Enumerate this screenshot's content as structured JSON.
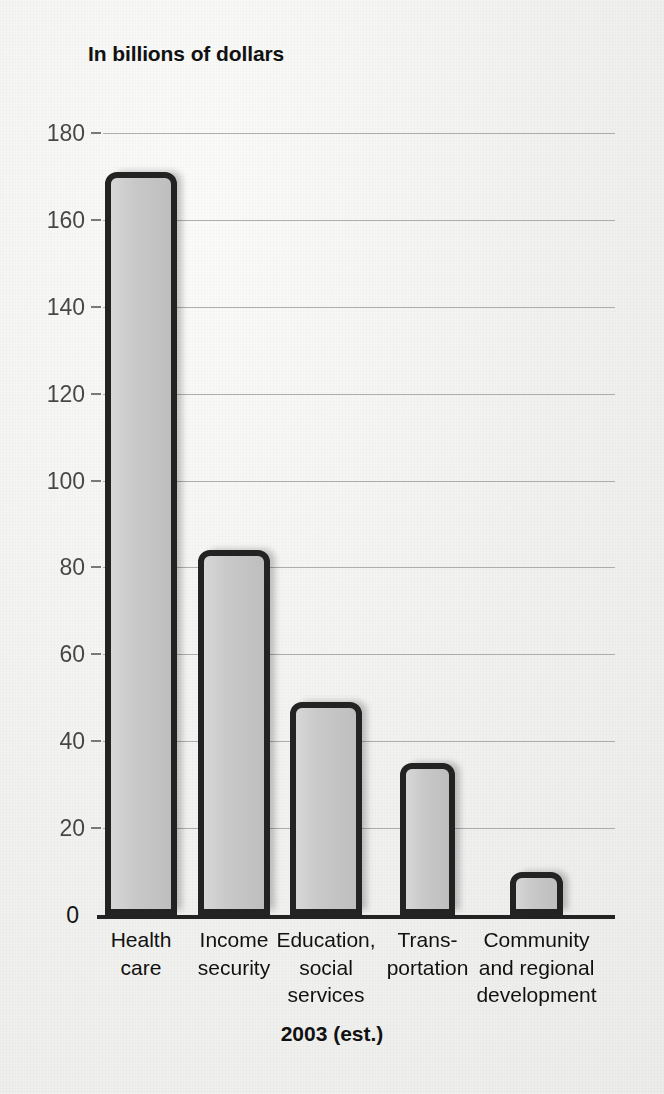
{
  "chart_data": {
    "type": "bar",
    "title": "In billions of dollars",
    "xlabel": "2003 (est.)",
    "ylabel": "",
    "categories": [
      "Health\ncare",
      "Income\nsecurity",
      "Education,\nsocial\nservices",
      "Trans-\nportation",
      "Community\nand regional\ndevelopment"
    ],
    "values": [
      171,
      84,
      49,
      35,
      10
    ],
    "ylim": [
      0,
      180
    ],
    "yticks": [
      0,
      20,
      40,
      60,
      80,
      100,
      120,
      140,
      160,
      180
    ],
    "ytick_labels": [
      "0",
      "20",
      "40",
      "60",
      "80",
      "100",
      "120",
      "140",
      "160",
      "180"
    ],
    "grid": true,
    "legend": false,
    "legend_position": "none",
    "colors": {
      "bar_fill": "#c6c6c6",
      "bar_outline": "#232323",
      "gridline": "#9a9a9a",
      "axis": "#232323",
      "text": "#111111",
      "background": "#f1f1ef"
    }
  },
  "figure": {
    "title": "In billions of dollars",
    "x_caption": "2003 (est.)"
  }
}
